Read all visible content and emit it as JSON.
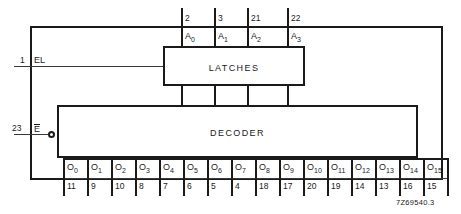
{
  "figure": {
    "id_label": "7Z69540.3",
    "blocks": {
      "latches": "LATCHES",
      "decoder": "DECODER"
    },
    "inputs": {
      "enable_latch": {
        "pin": "1",
        "label": "EL"
      },
      "enable_bar": {
        "pin": "23",
        "label": "E"
      }
    },
    "address_inputs": [
      {
        "pin": "2",
        "name": "A",
        "index": "0"
      },
      {
        "pin": "3",
        "name": "A",
        "index": "1"
      },
      {
        "pin": "21",
        "name": "A",
        "index": "2"
      },
      {
        "pin": "22",
        "name": "A",
        "index": "3"
      }
    ],
    "outputs": [
      {
        "name": "O",
        "index": "0",
        "pin": "11"
      },
      {
        "name": "O",
        "index": "1",
        "pin": "9"
      },
      {
        "name": "O",
        "index": "2",
        "pin": "10"
      },
      {
        "name": "O",
        "index": "3",
        "pin": "8"
      },
      {
        "name": "O",
        "index": "4",
        "pin": "7"
      },
      {
        "name": "O",
        "index": "5",
        "pin": "6"
      },
      {
        "name": "O",
        "index": "6",
        "pin": "5"
      },
      {
        "name": "O",
        "index": "7",
        "pin": "4"
      },
      {
        "name": "O",
        "index": "8",
        "pin": "18"
      },
      {
        "name": "O",
        "index": "9",
        "pin": "17"
      },
      {
        "name": "O",
        "index": "10",
        "pin": "20"
      },
      {
        "name": "O",
        "index": "11",
        "pin": "19"
      },
      {
        "name": "O",
        "index": "12",
        "pin": "14"
      },
      {
        "name": "O",
        "index": "13",
        "pin": "13"
      },
      {
        "name": "O",
        "index": "14",
        "pin": "16"
      },
      {
        "name": "O",
        "index": "15",
        "pin": "15"
      }
    ],
    "colors": {
      "line": "#1a1a1a",
      "background": "#ffffff"
    }
  }
}
